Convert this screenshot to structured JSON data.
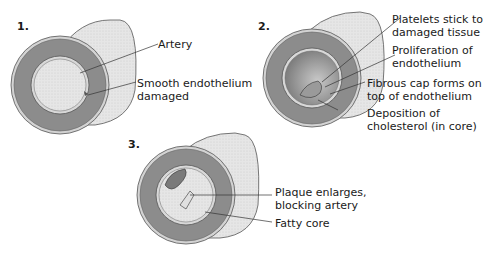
{
  "panels": [
    {
      "number": "1.",
      "labels": [
        {
          "line1": "Artery",
          "line2": ""
        },
        {
          "line1": "Smooth endothelium",
          "line2": "damaged"
        }
      ]
    },
    {
      "number": "2.",
      "labels": [
        {
          "line1": "Platelets stick to",
          "line2": "damaged tissue"
        },
        {
          "line1": "Proliferation of",
          "line2": "endothelium"
        },
        {
          "line1": "Fibrous cap forms on",
          "line2": "top of endothelium"
        },
        {
          "line1": "Deposition of",
          "line2": "cholesterol (in core)"
        }
      ]
    },
    {
      "number": "3.",
      "labels": [
        {
          "line1": "Plaque enlarges,",
          "line2": "blocking artery"
        },
        {
          "line1": "Fatty core",
          "line2": ""
        }
      ]
    }
  ],
  "colors": {
    "outer_wall": "#d9d9d9",
    "wall_ring": "#8a8a8a",
    "lumen": "#ececec",
    "plaque": "#9a9a9a"
  }
}
